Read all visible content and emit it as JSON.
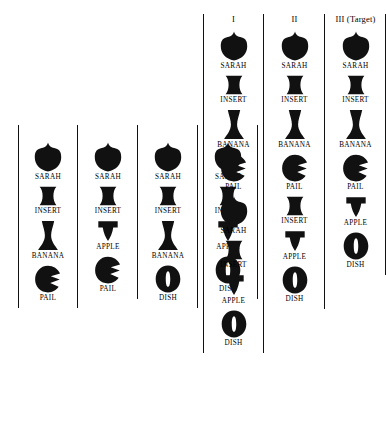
{
  "figure": {
    "shapes": {
      "SARAH": "acorn-shield-shape",
      "INSERT": "hourglass-bowtie-shape",
      "BANANA": "cooling-tower-vase-shape",
      "PAIL": "notched-circle-shape",
      "APPLE": "inverted-funnel-shape",
      "DISH": "slotted-oval-shape"
    },
    "colors": {
      "shape_fill": "#111111",
      "rule": "#111111",
      "background": "#ffffff",
      "text": "#000000"
    },
    "left_group": {
      "columns": [
        {
          "header": "",
          "items": [
            "SARAH",
            "INSERT",
            "BANANA",
            "PAIL"
          ]
        },
        {
          "header": "",
          "items": [
            "SARAH",
            "INSERT",
            "APPLE",
            "PAIL"
          ]
        },
        {
          "header": "",
          "items": [
            "SARAH",
            "INSERT",
            "BANANA",
            "DISH"
          ]
        },
        {
          "header": "",
          "items": [
            "SARAH",
            "INSERT",
            "APPLE",
            "DISH"
          ]
        }
      ]
    },
    "right_group": {
      "columns": [
        {
          "header": "I",
          "items": [
            "SARAH",
            "INSERT",
            "BANANA",
            "PAIL",
            "SARAH",
            "INSERT",
            "APPLE",
            "DISH"
          ]
        },
        {
          "header": "II",
          "items": [
            "SARAH",
            "INSERT",
            "BANANA",
            "PAIL",
            "INSERT",
            "APPLE",
            "DISH"
          ]
        },
        {
          "header": "III (Target)",
          "items": [
            "SARAH",
            "INSERT",
            "BANANA",
            "PAIL",
            "APPLE",
            "DISH"
          ]
        }
      ]
    }
  }
}
